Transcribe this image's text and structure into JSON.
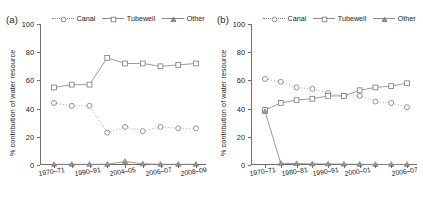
{
  "figure": {
    "ylabel": "% contribution of water resource",
    "legend": {
      "canal": "Canal",
      "tubewell": "Tubewell",
      "other": "Other"
    }
  },
  "panels": [
    {
      "tag": "(a)",
      "ylabel": "% contribution of water resource",
      "yticks": [
        "0",
        "20",
        "40",
        "60",
        "80",
        "100"
      ],
      "xticklabels": [
        "1970–71",
        "1990–91",
        "2004–05",
        "2006–07",
        "2008–09"
      ]
    },
    {
      "tag": "(b)",
      "ylabel": "% contribution of water resource",
      "yticks": [
        "0",
        "20",
        "40",
        "60",
        "80",
        "100"
      ],
      "xticklabels": [
        "1970–71",
        "1980–81",
        "1990–91",
        "2000–01",
        "2006–07"
      ]
    }
  ],
  "chart_data": [
    {
      "type": "line",
      "panel": "(a)",
      "title": "",
      "xlabel": "",
      "ylabel": "% contribution of water resource",
      "ylim": [
        0,
        100
      ],
      "grid": false,
      "legend_position": "top",
      "categories": [
        "1970–71",
        "1980–81",
        "1990–91",
        "2000–01",
        "2004–05",
        "2005–06",
        "2006–07",
        "2007–08",
        "2008–09"
      ],
      "xtick_categories": [
        "1970–71",
        "1990–91",
        "2004–05",
        "2006–07",
        "2008–09"
      ],
      "series": [
        {
          "name": "Canal",
          "marker": "circle",
          "linestyle": "dotted",
          "values": [
            44,
            42,
            42,
            23,
            27,
            24,
            27,
            26,
            26
          ]
        },
        {
          "name": "Tubewell",
          "marker": "square",
          "linestyle": "solid",
          "values": [
            55,
            57,
            57,
            76,
            72,
            72,
            70,
            71,
            72
          ]
        },
        {
          "name": "Other",
          "marker": "triangle",
          "linestyle": "solid",
          "values": [
            0.5,
            0.5,
            0.5,
            0.5,
            2.5,
            0.8,
            0.5,
            0.5,
            0.5
          ]
        }
      ]
    },
    {
      "type": "line",
      "panel": "(b)",
      "title": "",
      "xlabel": "",
      "ylabel": "% contribution of water resource",
      "ylim": [
        0,
        100
      ],
      "grid": false,
      "legend_position": "top",
      "categories": [
        "1970–71",
        "1975–76",
        "1980–81",
        "1985–86",
        "1990–91",
        "1995–96",
        "2000–01",
        "2003–04",
        "2005–06",
        "2006–07"
      ],
      "xtick_categories": [
        "1970–71",
        "1980–81",
        "1990–91",
        "2000–01",
        "2006–07"
      ],
      "series": [
        {
          "name": "Canal",
          "marker": "circle",
          "linestyle": "dotted",
          "values": [
            61,
            59,
            55,
            54,
            51,
            49,
            49,
            45,
            44,
            41
          ]
        },
        {
          "name": "Tubewell",
          "marker": "square",
          "linestyle": "solid",
          "values": [
            39,
            44,
            46,
            47,
            49,
            49,
            53,
            55,
            56,
            58
          ]
        },
        {
          "name": "Other",
          "marker": "triangle",
          "linestyle": "solid",
          "values": [
            38,
            1.2,
            1,
            0.8,
            0.8,
            0.6,
            0.5,
            0.4,
            0.4,
            0.4
          ]
        }
      ]
    }
  ],
  "style": {
    "line_color": "#8a8a8a",
    "marker_edge": "#808080",
    "axis_color": "#6e6e6e",
    "text_color": "#222222"
  }
}
